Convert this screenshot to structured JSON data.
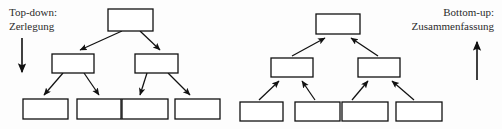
{
  "diagram": {
    "background_color": "#fdfdfd",
    "stroke_color": "#111111",
    "box_fill_color": "#ffffff",
    "text_color": "#2b2b2b",
    "left_panel": {
      "label_line1": "Top-down:",
      "label_line2": "Zerlegung",
      "direction_arrow": "down-arrow",
      "arrow_direction": "down",
      "edge_arrow_direction": "parent-to-child",
      "nodes": {
        "root": [
          {
            "x": 108,
            "y": 9,
            "w": 45,
            "h": 22
          }
        ],
        "middle": [
          {
            "x": 52,
            "y": 54,
            "w": 42,
            "h": 19
          },
          {
            "x": 135,
            "y": 54,
            "w": 43,
            "h": 19
          }
        ],
        "leaves": [
          {
            "x": 23,
            "y": 99,
            "w": 45,
            "h": 20
          },
          {
            "x": 77,
            "y": 99,
            "w": 44,
            "h": 20
          },
          {
            "x": 122,
            "y": 99,
            "w": 46,
            "h": 20
          },
          {
            "x": 175,
            "y": 99,
            "w": 45,
            "h": 20
          }
        ]
      }
    },
    "right_panel": {
      "label_line1": "Bottom-up:",
      "label_line2": "Zusammenfassung",
      "direction_arrow": "up-arrow",
      "arrow_direction": "up",
      "edge_arrow_direction": "child-to-parent",
      "nodes": {
        "root": [
          {
            "x": 316,
            "y": 14,
            "w": 44,
            "h": 20
          }
        ],
        "middle": [
          {
            "x": 271,
            "y": 58,
            "w": 42,
            "h": 19
          },
          {
            "x": 358,
            "y": 58,
            "w": 42,
            "h": 19
          }
        ],
        "leaves": [
          {
            "x": 240,
            "y": 102,
            "w": 43,
            "h": 19
          },
          {
            "x": 295,
            "y": 102,
            "w": 45,
            "h": 19
          },
          {
            "x": 342,
            "y": 102,
            "w": 46,
            "h": 19
          },
          {
            "x": 396,
            "y": 102,
            "w": 46,
            "h": 19
          }
        ]
      }
    }
  }
}
